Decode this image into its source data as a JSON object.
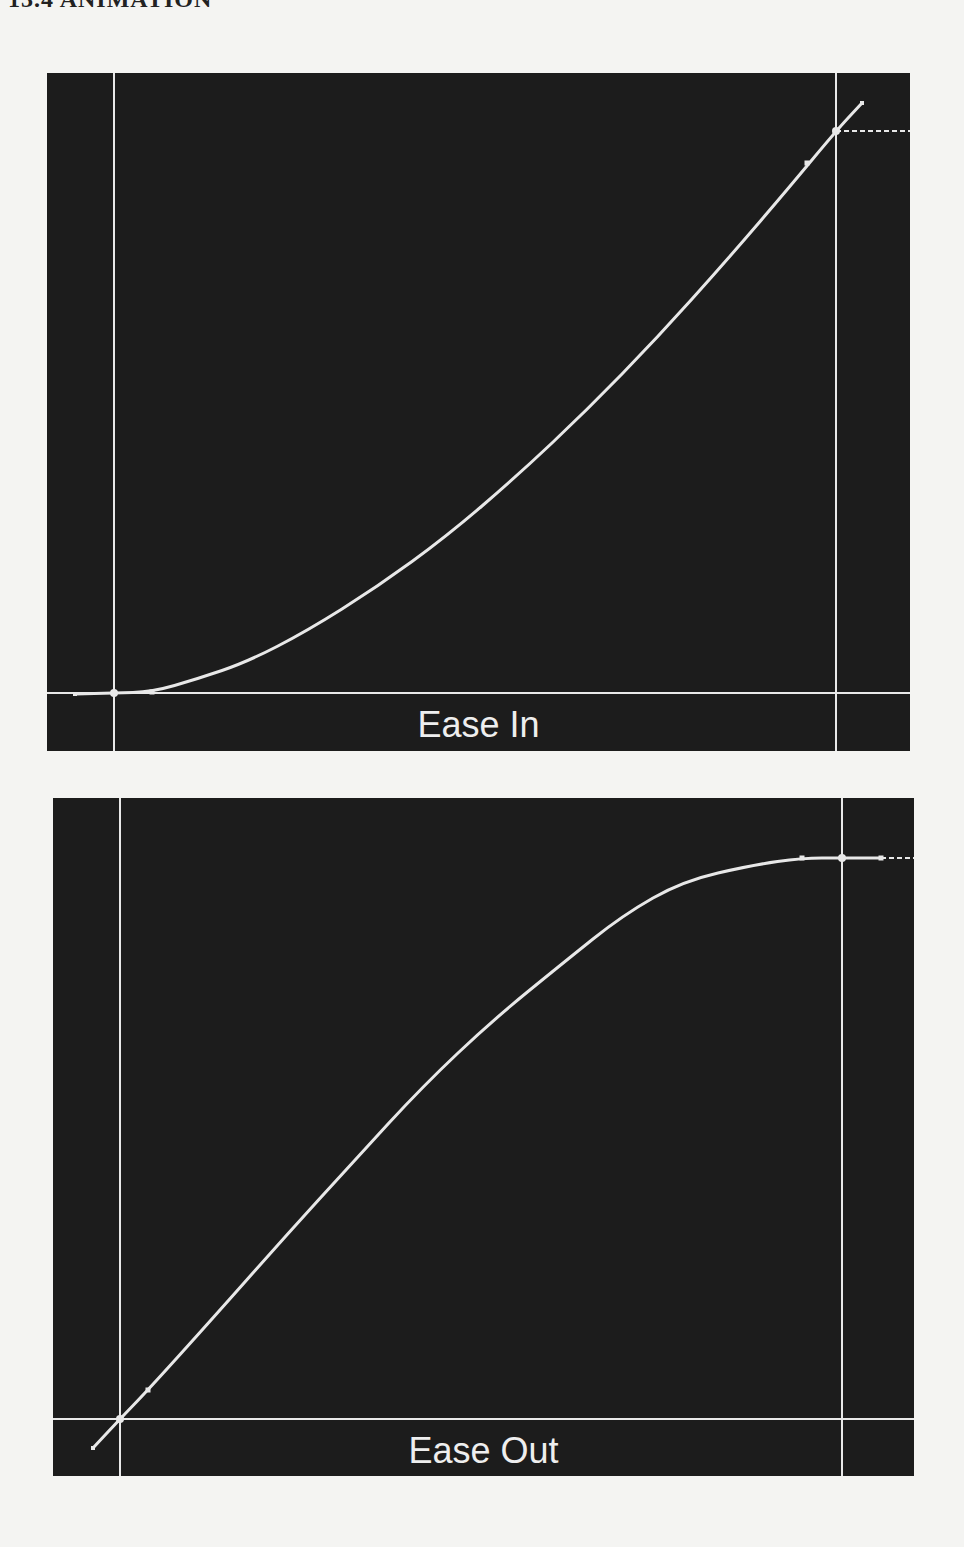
{
  "page": {
    "header_fragment": "13.4  ANIMATION"
  },
  "colors": {
    "panel_bg": "#1c1c1c",
    "line": "#e8e8e8",
    "page_bg": "#f4f4f2"
  },
  "panels": [
    {
      "label": "Ease In",
      "curve_type": "ease-in",
      "frame": {
        "left": 47,
        "top": 73,
        "width": 863,
        "height": 678
      },
      "guides": {
        "start_x": 67,
        "end_x": 789,
        "baseline_y": 620
      },
      "curve_points": [
        [
          28,
          621
        ],
        [
          67,
          620
        ],
        [
          105,
          619
        ],
        [
          150,
          606
        ],
        [
          200,
          589
        ],
        [
          260,
          558
        ],
        [
          330,
          514
        ],
        [
          400,
          463
        ],
        [
          470,
          403
        ],
        [
          540,
          337
        ],
        [
          610,
          265
        ],
        [
          680,
          187
        ],
        [
          740,
          117
        ],
        [
          789,
          58
        ],
        [
          815,
          30
        ]
      ],
      "start_key": [
        67,
        620
      ],
      "end_key": [
        789,
        58
      ],
      "handle_points": [
        [
          105,
          619
        ],
        [
          760,
          90
        ]
      ],
      "dashed_extension": {
        "x1": 789,
        "y1": 58,
        "x2": 863,
        "y2": 58
      }
    },
    {
      "label": "Ease Out",
      "curve_type": "ease-out",
      "frame": {
        "left": 53,
        "top": 798,
        "width": 861,
        "height": 678
      },
      "guides": {
        "start_x": 67,
        "end_x": 789,
        "baseline_y": 621
      },
      "curve_points": [
        [
          40,
          650
        ],
        [
          67,
          621
        ],
        [
          95,
          592
        ],
        [
          160,
          520
        ],
        [
          230,
          441
        ],
        [
          300,
          364
        ],
        [
          370,
          288
        ],
        [
          440,
          222
        ],
        [
          510,
          165
        ],
        [
          570,
          117
        ],
        [
          630,
          83
        ],
        [
          700,
          67
        ],
        [
          749,
          60
        ],
        [
          789,
          60
        ],
        [
          828,
          60
        ]
      ],
      "start_key": [
        67,
        621
      ],
      "end_key": [
        789,
        60
      ],
      "handle_points": [
        [
          95,
          592
        ],
        [
          749,
          60
        ],
        [
          828,
          60
        ]
      ],
      "dashed_extension": {
        "x1": 828,
        "y1": 60,
        "x2": 861,
        "y2": 60
      }
    }
  ],
  "chart_data": [
    {
      "type": "line",
      "title": "Ease In",
      "xlabel": "",
      "ylabel": "",
      "grid": false,
      "x": [
        0,
        0.1,
        0.2,
        0.3,
        0.4,
        0.5,
        0.6,
        0.7,
        0.8,
        0.9,
        1.0
      ],
      "values": [
        0,
        0.02,
        0.07,
        0.14,
        0.23,
        0.34,
        0.46,
        0.59,
        0.72,
        0.86,
        1.0
      ]
    },
    {
      "type": "line",
      "title": "Ease Out",
      "xlabel": "",
      "ylabel": "",
      "grid": false,
      "x": [
        0,
        0.1,
        0.2,
        0.3,
        0.4,
        0.5,
        0.6,
        0.7,
        0.8,
        0.9,
        1.0
      ],
      "values": [
        0,
        0.14,
        0.28,
        0.41,
        0.54,
        0.66,
        0.77,
        0.86,
        0.93,
        0.98,
        1.0
      ]
    }
  ]
}
